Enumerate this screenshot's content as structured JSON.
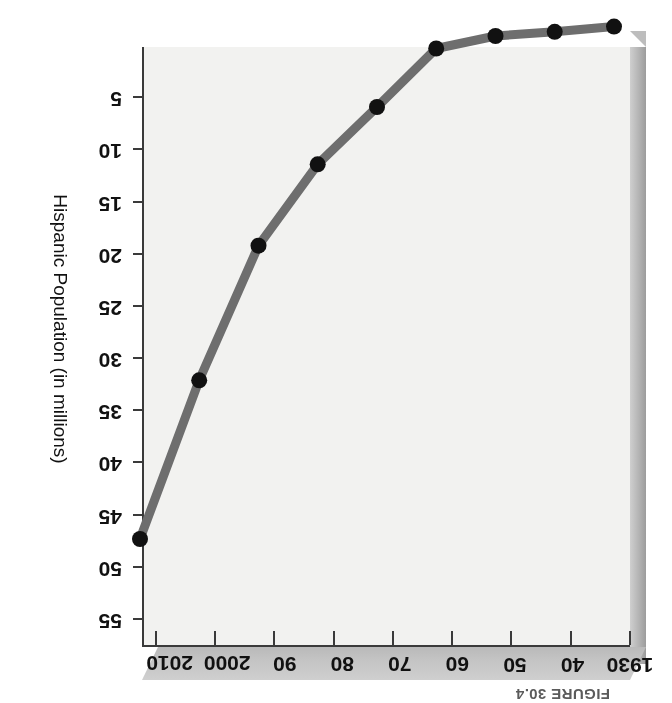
{
  "figure": {
    "caption": "FIGURE 30.4",
    "caption_visible_fragment": "FIGURE 30.4",
    "orientation_note": "page scanned upside-down"
  },
  "axes": {
    "x_tick_labels": [
      "1930",
      "40",
      "50",
      "60",
      "70",
      "80",
      "90",
      "2000",
      "2010"
    ],
    "y_tick_labels": [
      "5",
      "10",
      "15",
      "20",
      "25",
      "30",
      "35",
      "40",
      "45",
      "50",
      "55"
    ],
    "y_title": "Hispanic Population (in millions)",
    "x_title": ""
  },
  "colors": {
    "line": "#6e6e6e",
    "marker": "#111111",
    "axis": "#3a3a3a",
    "plot_bg": "#f2f2f0",
    "depth_face": "#c4c4c4",
    "caption": "#5b5b5b"
  },
  "bleed_text": [
    "the immigrants who came to the United",
    "States in the late nineteenth century, most",
    "of these newcomers were poor and came",
    "in search of a better life. Unlike earlier",
    "immigrants, however, they arrived in a",
    "nation whose economy was shifting away",
    "from manufacturing.",
    "",
    "Hispanics became the largest minority",
    "group in the United States, surpassing",
    "African Americans. The Hispanic share of",
    "the population grew rapidly in states such",
    "as California, Texas, Florida, and New",
    "York, reshaping American culture.",
    "",
    "The new immigration also transformed",
    "the nation's religious landscape, with",
    "growing numbers of Catholics, Muslims,",
    "Hindus, and Buddhists."
  ],
  "chart_data": {
    "type": "line",
    "title": "FIGURE 30.4",
    "xlabel": "",
    "ylabel": "Hispanic Population (in millions)",
    "x": [
      1930,
      1940,
      1950,
      1960,
      1970,
      1980,
      1990,
      2000,
      2010
    ],
    "categories": [
      "1930",
      "40",
      "50",
      "60",
      "70",
      "80",
      "90",
      "2000",
      "2010"
    ],
    "values": [
      1.4,
      1.9,
      2.3,
      3.5,
      9.1,
      14.6,
      22.4,
      35.3,
      50.5
    ],
    "xlim": [
      1930,
      2010
    ],
    "ylim": [
      0,
      57.5
    ],
    "yticks": [
      5,
      10,
      15,
      20,
      25,
      30,
      35,
      40,
      45,
      50,
      55
    ],
    "grid": false,
    "legend": false,
    "markers": true,
    "series": [
      {
        "name": "Hispanic Population (in millions)",
        "values": [
          1.4,
          1.9,
          2.3,
          3.5,
          9.1,
          14.6,
          22.4,
          35.3,
          50.5
        ]
      }
    ]
  }
}
